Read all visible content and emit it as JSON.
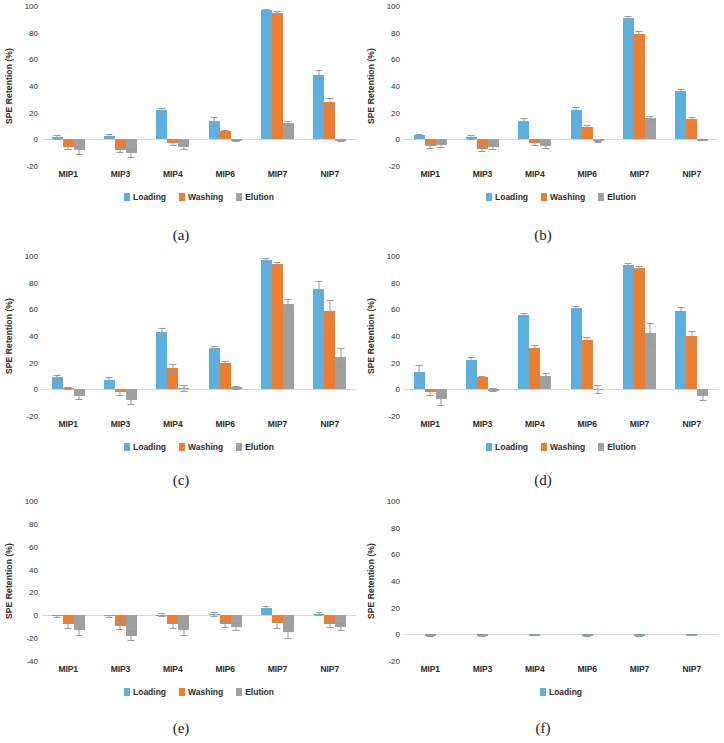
{
  "figure": {
    "ylabel": "SPE Retention (%)",
    "categories": [
      "MIP1",
      "MIP3",
      "MIP4",
      "MIP6",
      "MIP7",
      "NIP7"
    ],
    "series_names": [
      "Loading",
      "Washing",
      "Elution"
    ],
    "colors": {
      "loading": "#5BB0E0",
      "washing": "#ED7D31",
      "elution": "#A0A0A0",
      "error_bar": "#9A9A9A",
      "background": "#FFFFFF"
    }
  },
  "chart_data": [
    {
      "type": "bar",
      "panel": "a",
      "caption": "(a)",
      "title": "",
      "xlabel": "",
      "ylabel": "SPE Retention (%)",
      "ylim": [
        -20,
        100
      ],
      "yticks": [
        -20,
        0,
        20,
        40,
        60,
        80,
        100
      ],
      "grid": false,
      "legend_position": "bottom",
      "categories": [
        "MIP1",
        "MIP3",
        "MIP4",
        "MIP6",
        "MIP7",
        "NIP7"
      ],
      "series": [
        {
          "name": "Loading",
          "values": [
            2,
            2.5,
            22,
            14,
            97,
            48
          ],
          "errors": [
            1.5,
            1.5,
            1.5,
            2.5,
            1,
            4
          ]
        },
        {
          "name": "Washing",
          "values": [
            -6,
            -8,
            -3,
            6,
            95,
            28
          ],
          "errors": [
            1.5,
            1.5,
            1.5,
            1,
            1,
            3
          ]
        },
        {
          "name": "Elution",
          "values": [
            -8,
            -10,
            -6,
            -0.5,
            12,
            -0.5
          ],
          "errors": [
            3,
            3,
            1.5,
            0.5,
            1.5,
            0.5
          ]
        }
      ]
    },
    {
      "type": "bar",
      "panel": "b",
      "caption": "(b)",
      "title": "",
      "xlabel": "",
      "ylabel": "SPE Retention (%)",
      "ylim": [
        -20,
        100
      ],
      "yticks": [
        -20,
        0,
        20,
        40,
        60,
        80,
        100
      ],
      "grid": false,
      "legend_position": "bottom",
      "categories": [
        "MIP1",
        "MIP3",
        "MIP4",
        "MIP6",
        "MIP7",
        "NIP7"
      ],
      "series": [
        {
          "name": "Loading",
          "values": [
            3,
            2,
            14,
            22,
            91,
            36
          ],
          "errors": [
            1,
            1.5,
            2,
            2,
            1.5,
            1.5
          ]
        },
        {
          "name": "Washing",
          "values": [
            -5,
            -7,
            -3,
            9,
            79,
            15
          ],
          "errors": [
            1.5,
            2,
            1.5,
            1.5,
            2,
            1.5
          ]
        },
        {
          "name": "Elution",
          "values": [
            -4,
            -6,
            -5,
            -1.5,
            16,
            0
          ],
          "errors": [
            1.5,
            1.5,
            1.5,
            0.5,
            1.5,
            0.5
          ]
        }
      ]
    },
    {
      "type": "bar",
      "panel": "c",
      "caption": "(c)",
      "title": "",
      "xlabel": "",
      "ylabel": "SPE Retention (%)",
      "ylim": [
        -20,
        100
      ],
      "yticks": [
        -20,
        0,
        20,
        40,
        60,
        80,
        100
      ],
      "grid": false,
      "legend_position": "bottom",
      "categories": [
        "MIP1",
        "MIP3",
        "MIP4",
        "MIP6",
        "MIP7",
        "NIP7"
      ],
      "series": [
        {
          "name": "Loading",
          "values": [
            9,
            7,
            43,
            31,
            97,
            75
          ],
          "errors": [
            2,
            2,
            3,
            1.5,
            1.5,
            6
          ]
        },
        {
          "name": "Washing",
          "values": [
            1,
            -2,
            16,
            20,
            94,
            59
          ],
          "errors": [
            1,
            2,
            3,
            1.5,
            1.5,
            8
          ]
        },
        {
          "name": "Elution",
          "values": [
            -5,
            -8,
            1,
            1.5,
            64,
            24
          ],
          "errors": [
            2,
            3,
            2,
            1,
            4,
            7
          ]
        }
      ]
    },
    {
      "type": "bar",
      "panel": "d",
      "caption": "(d)",
      "title": "",
      "xlabel": "",
      "ylabel": "SPE Retention (%)",
      "ylim": [
        -20,
        100
      ],
      "yticks": [
        -20,
        0,
        20,
        40,
        60,
        80,
        100
      ],
      "grid": false,
      "legend_position": "bottom",
      "categories": [
        "MIP1",
        "MIP3",
        "MIP4",
        "MIP6",
        "MIP7",
        "NIP7"
      ],
      "series": [
        {
          "name": "Loading",
          "values": [
            13,
            22,
            56,
            61,
            93,
            59
          ],
          "errors": [
            5,
            2,
            1.5,
            1.5,
            2,
            3
          ]
        },
        {
          "name": "Washing",
          "values": [
            -2,
            9,
            31,
            37,
            91,
            40
          ],
          "errors": [
            2,
            1,
            2,
            2,
            1.5,
            4
          ]
        },
        {
          "name": "Elution",
          "values": [
            -7,
            0,
            10,
            0.5,
            42,
            -5
          ],
          "errors": [
            5,
            1,
            2.5,
            3,
            8,
            3
          ]
        }
      ]
    },
    {
      "type": "bar",
      "panel": "e",
      "caption": "(e)",
      "title": "",
      "xlabel": "",
      "ylabel": "SPE Retention (%)",
      "ylim": [
        -40,
        100
      ],
      "yticks": [
        -40,
        -20,
        0,
        20,
        40,
        60,
        80,
        100
      ],
      "grid": false,
      "legend_position": "bottom",
      "categories": [
        "MIP1",
        "MIP3",
        "MIP4",
        "MIP6",
        "MIP7",
        "NIP7"
      ],
      "series": [
        {
          "name": "Loading",
          "values": [
            -0.5,
            -0.5,
            0.5,
            1,
            6,
            1.5
          ],
          "errors": [
            1,
            1,
            1.5,
            1.5,
            2,
            1.5
          ]
        },
        {
          "name": "Washing",
          "values": [
            -8,
            -9,
            -8,
            -8,
            -7,
            -8
          ],
          "errors": [
            3,
            3,
            3,
            2,
            4,
            2
          ]
        },
        {
          "name": "Elution",
          "values": [
            -13,
            -18,
            -13,
            -10,
            -15,
            -10
          ],
          "errors": [
            4,
            4,
            4,
            3,
            5,
            3
          ]
        }
      ]
    },
    {
      "type": "bar",
      "panel": "f",
      "caption": "(f)",
      "title": "",
      "xlabel": "",
      "ylabel": "SPE Retention (%)",
      "ylim": [
        -20,
        100
      ],
      "yticks": [
        -20,
        0,
        20,
        40,
        60,
        80,
        100
      ],
      "grid": false,
      "legend_position": "bottom",
      "categories": [
        "MIP1",
        "MIP3",
        "MIP4",
        "MIP6",
        "MIP7",
        "NIP7"
      ],
      "series": [
        {
          "name": "Loading",
          "values": [
            -0.5,
            -0.5,
            -0.3,
            -0.5,
            -0.5,
            -0.3
          ],
          "errors": [
            0.5,
            0.5,
            0.3,
            0.5,
            0.5,
            0.3
          ]
        }
      ]
    }
  ]
}
